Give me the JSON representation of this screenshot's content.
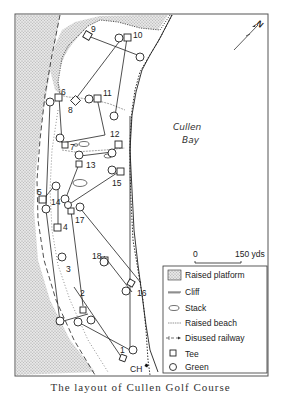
{
  "map": {
    "water_label_1": "Cullen",
    "water_label_2": "Bay",
    "north_arrow": {
      "label": "N",
      "icon": "north-arrow-icon"
    },
    "scale": {
      "start": "0",
      "end": "150 yds"
    },
    "clubhouse_label": "CH",
    "holes": [
      {
        "number": "1",
        "tee": [
          122,
          358
        ],
        "green": [
          130,
          350
        ]
      },
      {
        "number": "2",
        "tee": [
          82,
          310
        ],
        "green": [
          77,
          322
        ]
      },
      {
        "number": "3",
        "tee": [
          60,
          322
        ],
        "green": [
          88,
          314
        ]
      },
      {
        "number": "4",
        "tee": [
          58,
          227
        ],
        "green": [
          46,
          207
        ]
      },
      {
        "number": "5",
        "tee": [
          43,
          200
        ],
        "green": [
          55,
          185
        ]
      },
      {
        "number": "6",
        "tee": [
          59,
          97
        ],
        "green": [
          50,
          102
        ]
      },
      {
        "number": "7",
        "tee": [
          62,
          143
        ],
        "green": [
          59,
          140
        ]
      },
      {
        "number": "8",
        "tee": [
          75,
          100
        ],
        "green": [
          122,
          38
        ]
      },
      {
        "number": "9",
        "tee": [
          88,
          36
        ],
        "green": [
          140,
          56
        ]
      },
      {
        "number": "10",
        "tee": [
          127,
          38
        ],
        "green": [
          115,
          116
        ]
      },
      {
        "number": "11",
        "tee": [
          97,
          98
        ],
        "green": [
          90,
          99
        ]
      },
      {
        "number": "12",
        "tee": [
          118,
          145
        ],
        "green": [
          112,
          152
        ]
      },
      {
        "number": "13",
        "tee": [
          79,
          164
        ],
        "green": [
          80,
          156
        ]
      },
      {
        "number": "14",
        "tee": [
          68,
          205
        ],
        "green": [
          67,
          195
        ]
      },
      {
        "number": "15",
        "tee": [
          120,
          171
        ],
        "green": [
          112,
          170
        ]
      },
      {
        "number": "16",
        "tee": [
          141,
          283
        ],
        "green": [
          132,
          292
        ]
      },
      {
        "number": "17",
        "tee": [
          71,
          211
        ],
        "green": [
          80,
          208
        ]
      },
      {
        "number": "18",
        "tee": [
          74,
          287
        ],
        "green": [
          104,
          256
        ]
      }
    ]
  },
  "legend": {
    "items": [
      {
        "label": "Raised platform",
        "icon": "raised-platform-swatch-icon"
      },
      {
        "label": "Cliff",
        "icon": "cliff-line-icon"
      },
      {
        "label": "Stack",
        "icon": "stack-icon"
      },
      {
        "label": "Raised beach",
        "icon": "raised-beach-line-icon"
      },
      {
        "label": "Disused railway",
        "icon": "railway-line-icon"
      },
      {
        "label": "Tee",
        "icon": "tee-square-icon"
      },
      {
        "label": "Green",
        "icon": "green-circle-icon"
      }
    ]
  },
  "caption": "The layout of Cullen Golf Course",
  "colors": {
    "platform_fill": "#d9d9d9",
    "line": "#222222",
    "frame": "#555555"
  }
}
